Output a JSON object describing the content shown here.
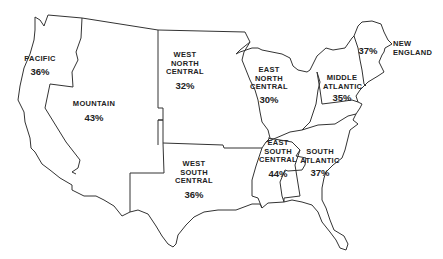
{
  "map": {
    "subject": "United States census regions",
    "regions": [
      {
        "name": "PACIFIC",
        "lines": [
          "PACIFIC"
        ],
        "value": "36%"
      },
      {
        "name": "MOUNTAIN",
        "lines": [
          "MOUNTAIN"
        ],
        "value": "43%"
      },
      {
        "name": "WEST NORTH CENTRAL",
        "lines": [
          "WEST",
          "NORTH",
          "CENTRAL"
        ],
        "value": "32%"
      },
      {
        "name": "EAST NORTH CENTRAL",
        "lines": [
          "EAST",
          "NORTH",
          "CENTRAL"
        ],
        "value": "30%"
      },
      {
        "name": "MIDDLE ATLANTIC",
        "lines": [
          "MIDDLE",
          "ATLANTIC"
        ],
        "value": "35%"
      },
      {
        "name": "NEW ENGLAND",
        "lines": [
          "NEW",
          "ENGLAND"
        ],
        "value": "37%"
      },
      {
        "name": "WEST SOUTH CENTRAL",
        "lines": [
          "WEST",
          "SOUTH",
          "CENTRAL"
        ],
        "value": "36%"
      },
      {
        "name": "EAST SOUTH CENTRAL",
        "lines": [
          "EAST",
          "SOUTH",
          "CENTRAL"
        ],
        "value": "44%"
      },
      {
        "name": "SOUTH ATLANTIC",
        "lines": [
          "SOUTH",
          "ATLANTIC"
        ],
        "value": "37%"
      }
    ]
  }
}
